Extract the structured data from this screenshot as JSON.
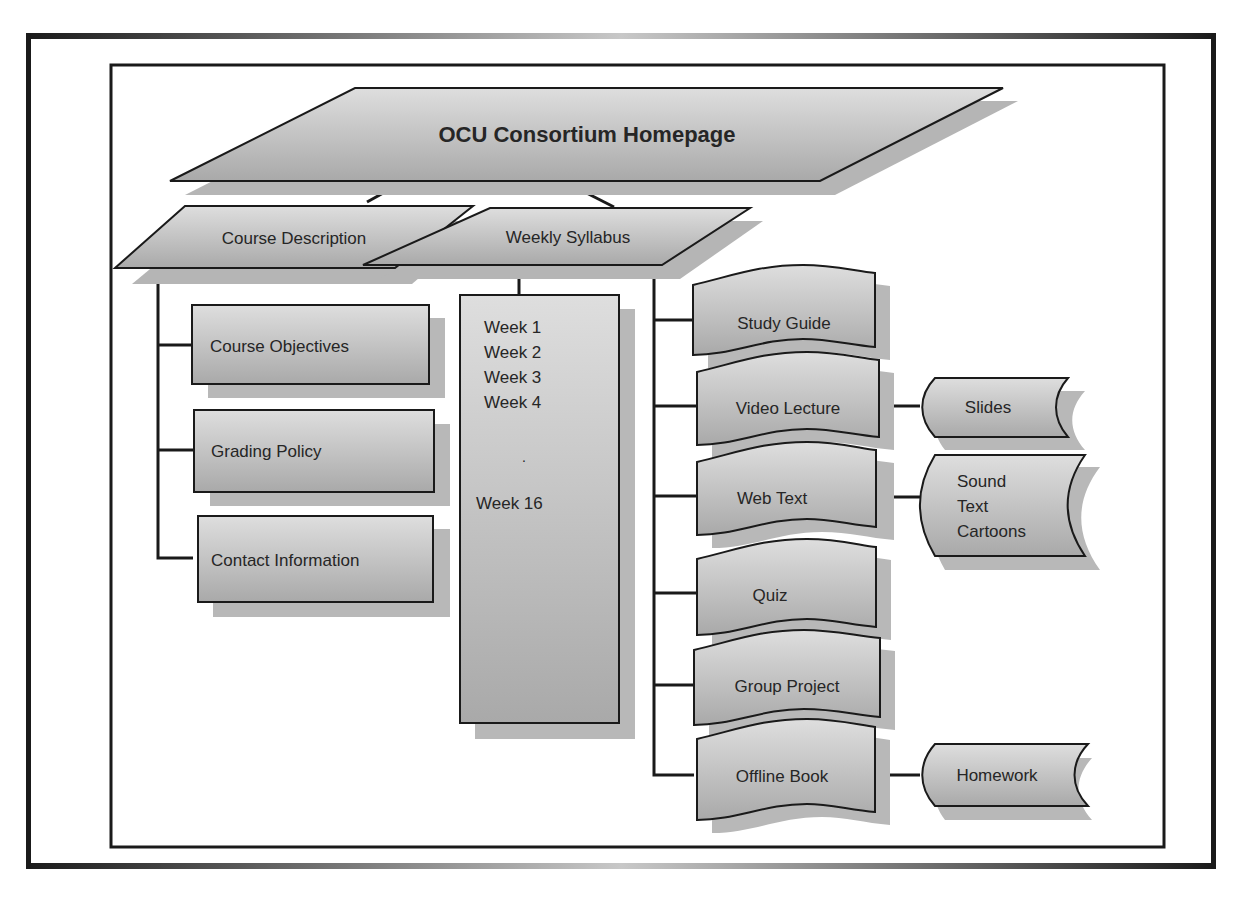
{
  "diagram": {
    "root": {
      "label": "OCU Consortium Homepage"
    },
    "level1": [
      {
        "id": "course-description",
        "label": "Course Description"
      },
      {
        "id": "weekly-syllabus",
        "label": "Weekly Syllabus"
      }
    ],
    "course_description_children": [
      {
        "label": "Course Objectives"
      },
      {
        "label": "Grading Policy"
      },
      {
        "label": "Contact Information"
      }
    ],
    "weeks_box": {
      "lines": [
        "Week 1",
        "Week 2",
        "Week 3",
        "Week 4"
      ],
      "ellipsis": ".",
      "last": "Week 16"
    },
    "syllabus_items": [
      {
        "label": "Study Guide"
      },
      {
        "label": "Video Lecture"
      },
      {
        "label": "Web Text"
      },
      {
        "label": "Quiz"
      },
      {
        "label": "Group Project"
      },
      {
        "label": "Offline Book"
      }
    ],
    "storage_items": {
      "slides": "Slides",
      "media": [
        "Sound",
        "Text",
        "Cartoons"
      ],
      "homework": "Homework"
    },
    "colors": {
      "shape_light": "#d9d9d9",
      "shape_dark": "#a6a6a6",
      "shadow": "#b3b3b3",
      "stroke": "#1a1a1a"
    }
  }
}
